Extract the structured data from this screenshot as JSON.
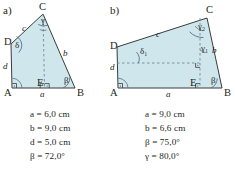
{
  "colors": {
    "fill": "#cfe7ec",
    "stroke": "#3b3b3b",
    "ink": "#231f20",
    "arc": "#5b6e86",
    "dash": "#6d8a96"
  },
  "panels": [
    {
      "key": "a",
      "label": "a)",
      "vertices": {
        "A": "A",
        "B": "B",
        "C": "C",
        "D": "D",
        "E": "E"
      },
      "edge_labels": {
        "a": "a",
        "b": "b",
        "c": "c",
        "d": "d"
      },
      "angle_labels": {
        "beta": "β",
        "gamma": "γ",
        "delta": "δ"
      },
      "given": [
        "a = 6,0 cm",
        "b = 9,0 cm",
        "d = 5,0 cm",
        "β = 72,0°"
      ]
    },
    {
      "key": "b",
      "label": "b)",
      "vertices": {
        "A": "A",
        "B": "B",
        "C": "C",
        "D": "D",
        "E": "E"
      },
      "edge_labels": {
        "a": "a",
        "b": "b",
        "c": "c",
        "d": "d"
      },
      "angle_labels": {
        "beta": "β",
        "gamma1": "γ₁",
        "gamma2": "γ₂",
        "delta1": "δ₁"
      },
      "given": [
        "a = 9,0 cm",
        "b = 6,6 cm",
        "β = 75,0°",
        "γ = 80,0°"
      ]
    }
  ]
}
